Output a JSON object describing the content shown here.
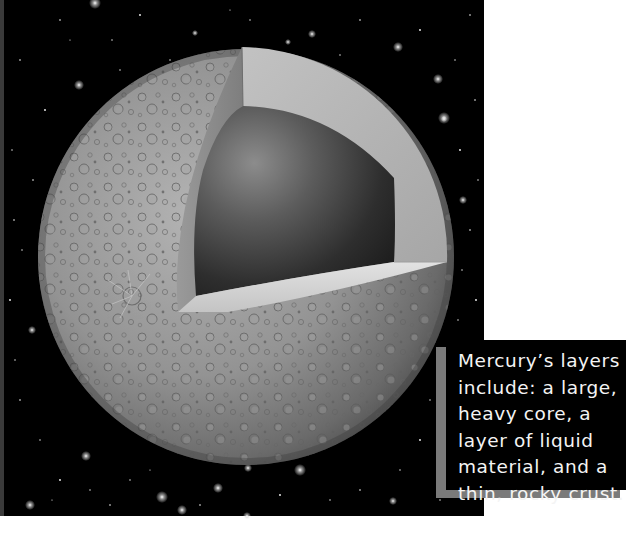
{
  "illustration": {
    "subject": "Mercury cutaway",
    "background": "starfield",
    "colors": {
      "space": "#000000",
      "page": "#ffffff",
      "crust": "#8e8e8e",
      "mantle_face": "#b5b5b5",
      "core": "#3a3a3a",
      "caption_bg": "#000000",
      "caption_shadow": "#7a7a7a",
      "caption_text": "#f4f4f4"
    }
  },
  "caption": {
    "lines": [
      "Mercury’s layers",
      "include: a large,",
      "heavy core, a",
      "layer of liquid",
      "material, and a",
      "thin, rocky crust."
    ]
  }
}
